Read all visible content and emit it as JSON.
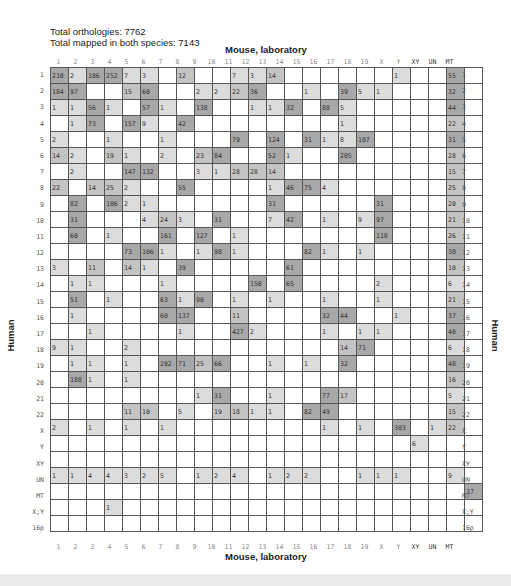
{
  "chart_data": {
    "type": "heatmap",
    "title_lines": [
      "Total orthologies: 7762",
      "Total mapped in both species: 7143"
    ],
    "xlabel": "Mouse, laboratory",
    "ylabel": "Human",
    "columns": [
      "1",
      "2",
      "3",
      "4",
      "5",
      "6",
      "7",
      "8",
      "9",
      "10",
      "11",
      "12",
      "13",
      "14",
      "15",
      "16",
      "17",
      "18",
      "19",
      "X",
      "Y",
      "XY",
      "UN",
      "MT"
    ],
    "rows": [
      "1",
      "2",
      "3",
      "4",
      "5",
      "6",
      "7",
      "8",
      "9",
      "10",
      "11",
      "12",
      "13",
      "14",
      "15",
      "16",
      "17",
      "18",
      "19",
      "20",
      "21",
      "22",
      "X",
      "Y",
      "XY",
      "UN",
      "MT",
      "X;Y",
      "16p"
    ],
    "cells": [
      [
        "210",
        "2",
        "186",
        "252",
        "7",
        "3",
        "",
        "12",
        "",
        "",
        "7",
        "3",
        "14",
        "",
        "",
        "",
        "",
        "",
        "",
        "1",
        "",
        "",
        "55",
        ""
      ],
      [
        "184",
        "97",
        "",
        "",
        "15",
        "60",
        "",
        "",
        "2",
        "2",
        "22",
        "36",
        "",
        "",
        "1",
        "",
        "39",
        "5",
        "1",
        "",
        "",
        "",
        "32",
        ""
      ],
      [
        "1",
        "1",
        "56",
        "1",
        "",
        "57",
        "1",
        "",
        "138",
        "",
        "",
        "1",
        "1",
        "32",
        "",
        "88",
        "5",
        "",
        "",
        "",
        "",
        "",
        "44",
        ""
      ],
      [
        "",
        "1",
        "73",
        "",
        "157",
        "9",
        "",
        "42",
        "",
        "",
        "",
        "",
        "",
        "",
        "",
        "",
        "1",
        "",
        "",
        "",
        "",
        "",
        "22",
        ""
      ],
      [
        "2",
        "",
        "",
        "1",
        "",
        "",
        "1",
        "",
        "",
        "",
        "79",
        "",
        "124",
        "",
        "31",
        "1",
        "8",
        "107",
        "",
        "",
        "",
        "",
        "31",
        ""
      ],
      [
        "14",
        "2",
        "",
        "19",
        "1",
        "",
        "2",
        "",
        "23",
        "84",
        "",
        "",
        "52",
        "1",
        "",
        "",
        "205",
        "",
        "",
        "",
        "",
        "",
        "28",
        ""
      ],
      [
        "",
        "2",
        "",
        "",
        "147",
        "132",
        "",
        "",
        "3",
        "1",
        "28",
        "28",
        "14",
        "",
        "",
        "",
        "",
        "",
        "",
        "",
        "",
        "",
        "15",
        ""
      ],
      [
        "22",
        "",
        "14",
        "25",
        "2",
        "",
        "",
        "55",
        "",
        "",
        "",
        "",
        "1",
        "46",
        "75",
        "4",
        "",
        "",
        "",
        "",
        "",
        "",
        "25",
        ""
      ],
      [
        "",
        "82",
        "",
        "106",
        "2",
        "1",
        "",
        "",
        "",
        "",
        "",
        "",
        "31",
        "",
        "",
        "",
        "",
        "",
        "31",
        "",
        "",
        "",
        "20",
        ""
      ],
      [
        "",
        "31",
        "",
        "",
        "",
        "4",
        "24",
        "3",
        "",
        "31",
        "",
        "",
        "7",
        "42",
        "",
        "1",
        "",
        "9",
        "97",
        "",
        "",
        "",
        "21",
        ""
      ],
      [
        "",
        "60",
        "",
        "1",
        "",
        "",
        "161",
        "",
        "127",
        "",
        "1",
        "",
        "",
        "",
        "",
        "",
        "",
        "",
        "118",
        "",
        "",
        "",
        "26",
        ""
      ],
      [
        "",
        "",
        "",
        "",
        "73",
        "106",
        "1",
        "",
        "1",
        "98",
        "1",
        "",
        "",
        "",
        "82",
        "1",
        "",
        "1",
        "",
        "",
        "",
        "",
        "30",
        ""
      ],
      [
        "3",
        "",
        "11",
        "",
        "14",
        "1",
        "",
        "39",
        "",
        "",
        "",
        "",
        "",
        "61",
        "",
        "",
        "",
        "",
        "",
        "",
        "",
        "",
        "10",
        ""
      ],
      [
        "",
        "1",
        "1",
        "",
        "",
        "",
        "1",
        "",
        "",
        "",
        "",
        "150",
        "",
        "65",
        "",
        "",
        "",
        "",
        "2",
        "",
        "",
        "",
        "6",
        ""
      ],
      [
        "",
        "51",
        "",
        "1",
        "",
        "",
        "63",
        "1",
        "90",
        "",
        "1",
        "",
        "1",
        "",
        "",
        "1",
        "",
        "",
        "1",
        "",
        "",
        "",
        "21",
        ""
      ],
      [
        "",
        "1",
        "",
        "",
        "",
        "",
        "60",
        "137",
        "",
        "",
        "11",
        "",
        "",
        "",
        "",
        "32",
        "44",
        "",
        "",
        "1",
        "",
        "",
        "37",
        ""
      ],
      [
        "",
        "",
        "1",
        "",
        "",
        "",
        "",
        "1",
        "",
        "",
        "427",
        "2",
        "",
        "",
        "",
        "1",
        "",
        "1",
        "1",
        "",
        "",
        "",
        "40",
        ""
      ],
      [
        "9",
        "1",
        "",
        "",
        "2",
        "",
        "",
        "",
        "",
        "",
        "",
        "",
        "",
        "",
        "",
        "",
        "14",
        "71",
        "",
        "",
        "",
        "",
        "6",
        ""
      ],
      [
        "",
        "1",
        "1",
        "",
        "1",
        "",
        "202",
        "71",
        "25",
        "66",
        "",
        "",
        "1",
        "",
        "1",
        "",
        "32",
        "",
        "",
        "",
        "",
        "",
        "48",
        ""
      ],
      [
        "",
        "188",
        "1",
        "",
        "1",
        "",
        "",
        "",
        "",
        "",
        "",
        "",
        "",
        "",
        "",
        "",
        "",
        "",
        "",
        "",
        "",
        "",
        "16",
        ""
      ],
      [
        "",
        "",
        "",
        "",
        "",
        "",
        "",
        "",
        "1",
        "31",
        "",
        "",
        "1",
        "",
        "",
        "77",
        "17",
        "",
        "",
        "",
        "",
        "",
        "5",
        ""
      ],
      [
        "",
        "",
        "",
        "",
        "11",
        "10",
        "",
        "5",
        "",
        "19",
        "18",
        "1",
        "1",
        "",
        "82",
        "49",
        "",
        "",
        "",
        "",
        "",
        "",
        "15",
        ""
      ],
      [
        "2",
        "",
        "1",
        "",
        "1",
        "",
        "1",
        "",
        "",
        "",
        "",
        "",
        "",
        "",
        "",
        "1",
        "",
        "1",
        "",
        "303",
        "",
        "1",
        "22",
        ""
      ],
      [
        "",
        "",
        "",
        "",
        "",
        "",
        "",
        "",
        "",
        "",
        "",
        "",
        "",
        "",
        "",
        "",
        "",
        "",
        "",
        "",
        "6",
        "",
        "",
        ""
      ],
      [
        "",
        "",
        "",
        "",
        "",
        "",
        "",
        "",
        "",
        "",
        "",
        "",
        "",
        "",
        "",
        "",
        "",
        "",
        "",
        "",
        "",
        "",
        "",
        ""
      ],
      [
        "1",
        "1",
        "4",
        "4",
        "3",
        "2",
        "5",
        "",
        "1",
        "2",
        "4",
        "",
        "1",
        "2",
        "2",
        "",
        "",
        "1",
        "1",
        "1",
        "",
        "",
        "9",
        ""
      ],
      [
        "",
        "",
        "",
        "",
        "",
        "",
        "",
        "",
        "",
        "",
        "",
        "",
        "",
        "",
        "",
        "",
        "",
        "",
        "",
        "",
        "",
        "",
        "",
        "37"
      ],
      [
        "",
        "",
        "",
        "1",
        "",
        "",
        "",
        "",
        "",
        "",
        "",
        "",
        "",
        "",
        "",
        "",
        "",
        "",
        "",
        "",
        "",
        "",
        "",
        ""
      ],
      [
        "",
        "",
        "",
        "",
        "",
        "",
        "",
        "",
        "",
        "",
        "",
        "",
        "",
        "",
        "",
        "",
        "",
        "",
        "",
        "",
        "",
        "",
        "",
        ""
      ]
    ],
    "shade_levels": {
      "empty": "#ffffff",
      "low": "#dcdcdc",
      "mid": "#c4c4c4",
      "high": "#a8a8a8"
    }
  },
  "header": {
    "total_orthologies": "Total orthologies: 7762",
    "total_mapped": "Total mapped in both species: 7143"
  },
  "axes": {
    "x_title": "Mouse, laboratory",
    "y_title": "Human"
  }
}
